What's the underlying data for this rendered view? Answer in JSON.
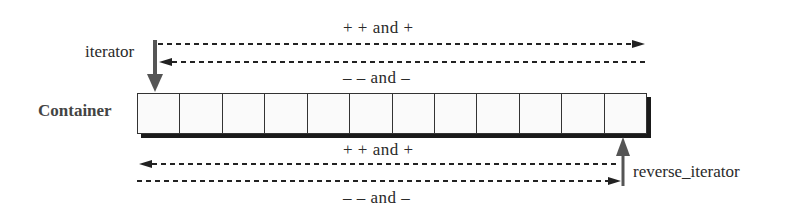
{
  "diagram": {
    "container_label": "Container",
    "cell_count": 12,
    "iterator": {
      "label": "iterator",
      "forward_ops": "+ +  and  +",
      "backward_ops": "– –  and  –"
    },
    "reverse_iterator": {
      "label": "reverse_iterator",
      "forward_ops": "+ +  and  +",
      "backward_ops": "– –  and  –"
    },
    "colors": {
      "arrow": "#555555",
      "line": "#222222",
      "shadow": "#1a1a1a"
    }
  }
}
